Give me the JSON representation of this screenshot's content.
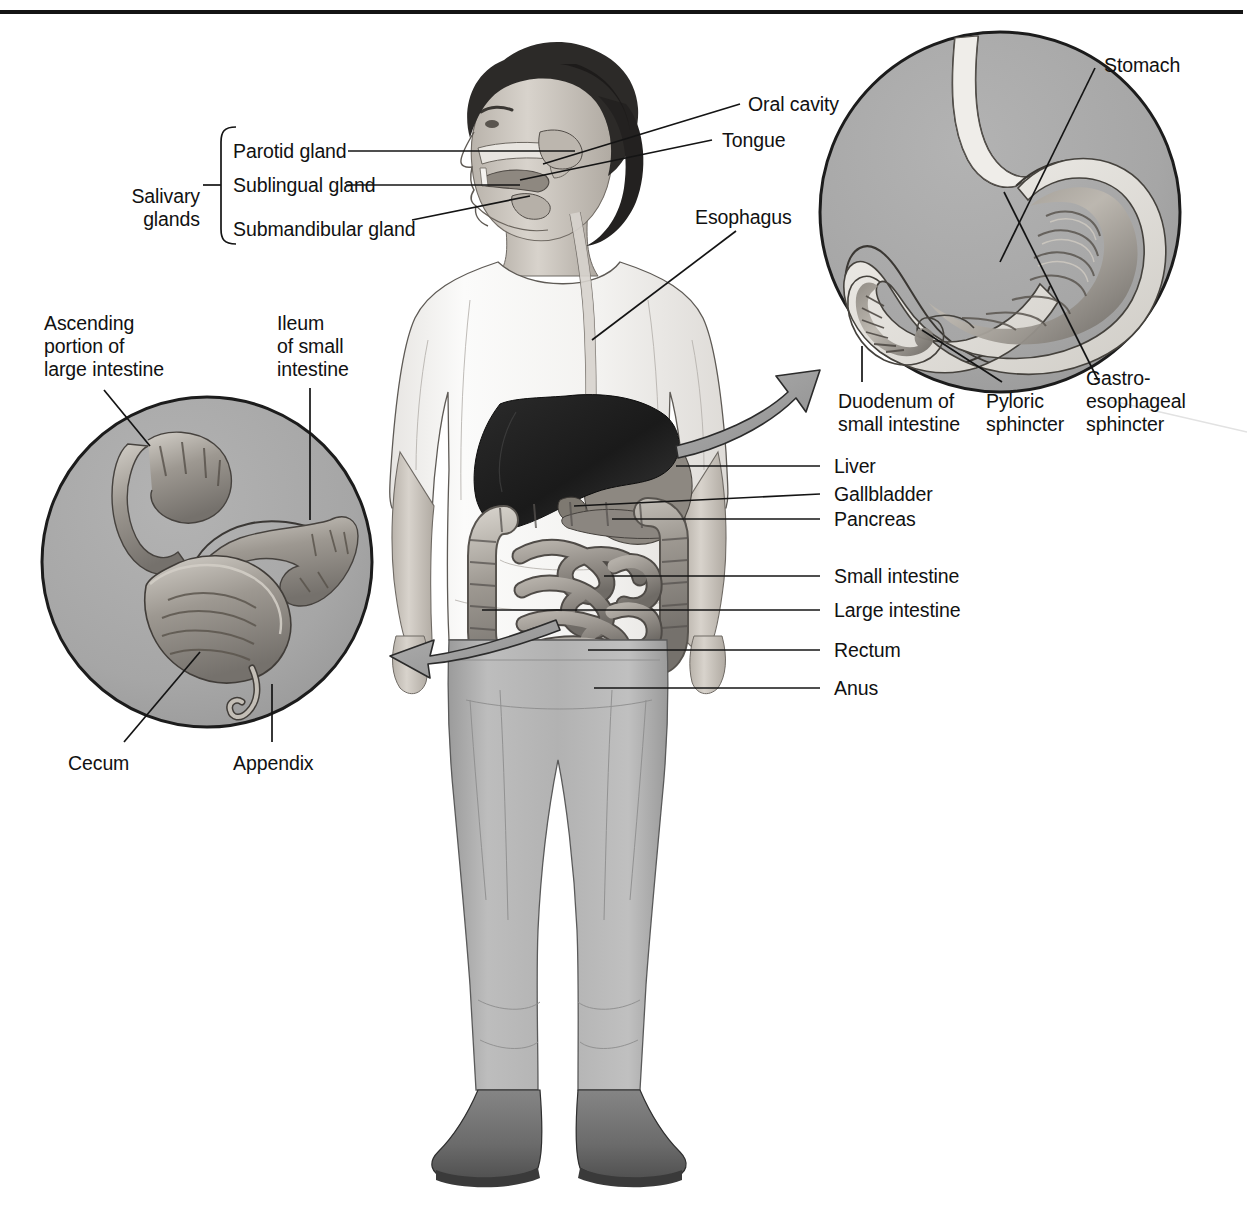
{
  "figure": {
    "top_rule": true,
    "colors": {
      "ink": "#111111",
      "leader_line": "#1a1a1a",
      "inset_fill": "#a6a6a6",
      "inset_stroke": "#1c1c1c",
      "arrow_fill": "#9d9d9d",
      "skin": "#cfcac3",
      "shirt": "#f4f3f1",
      "jeans": "#b4b4b4",
      "shoe": "#6e6e6e",
      "hair": "#2b2b2b",
      "liver": "#1f1f1f",
      "organ": "#9a958f",
      "organ_dark": "#6d6a66"
    }
  },
  "labels": {
    "salivary_glands": "Salivary\nglands",
    "parotid_gland": "Parotid gland",
    "sublingual_gland": "Sublingual gland",
    "submandibular_gland": "Submandibular gland",
    "oral_cavity": "Oral cavity",
    "tongue": "Tongue",
    "esophagus": "Esophagus",
    "stomach": "Stomach",
    "duodenum": "Duodenum of\nsmall intestine",
    "pyloric_sphincter": "Pyloric\nsphincter",
    "gastroesophageal_sphincter": "Gastro-\nesophageal\nsphincter",
    "liver": "Liver",
    "gallbladder": "Gallbladder",
    "pancreas": "Pancreas",
    "small_intestine": "Small intestine",
    "large_intestine": "Large intestine",
    "rectum": "Rectum",
    "anus": "Anus",
    "ascending_portion": "Ascending\nportion of\nlarge intestine",
    "ileum": "Ileum\nof small\nintestine",
    "cecum": "Cecum",
    "appendix": "Appendix"
  },
  "insets": {
    "stomach_inset": {
      "name": "stomach-detail-circle",
      "cx": 1000,
      "cy": 212,
      "r": 180,
      "labels": [
        "Stomach",
        "Duodenum of small intestine",
        "Pyloric sphincter",
        "Gastro-esophageal sphincter"
      ]
    },
    "cecum_inset": {
      "name": "cecum-detail-circle",
      "cx": 207,
      "cy": 562,
      "r": 165,
      "labels": [
        "Ascending portion of large intestine",
        "Ileum of small intestine",
        "Cecum",
        "Appendix"
      ]
    }
  }
}
